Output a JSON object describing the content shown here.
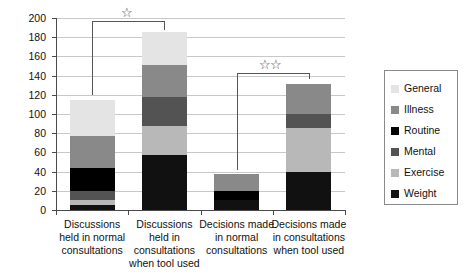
{
  "chart_data": {
    "type": "bar",
    "subtype": "stacked-bar",
    "title": "",
    "xlabel": "",
    "ylabel": "",
    "ylim": [
      0,
      200
    ],
    "ytick_step": 20,
    "yticks": [
      0,
      20,
      40,
      60,
      80,
      100,
      120,
      140,
      160,
      180,
      200
    ],
    "ytick_labels": [
      "0",
      "20",
      "40",
      "60",
      "80",
      "100",
      "120",
      "140",
      "160",
      "180",
      "200"
    ],
    "grid": true,
    "legend_position": "right",
    "categories": [
      "Discussions held in normal consultations",
      "Discussions held in consultations when tool used",
      "Decisions made in normal consultations",
      "Decisions made in consultations when tool used"
    ],
    "category_label_lines": [
      [
        "Discussions",
        "held in normal",
        "consultations"
      ],
      [
        "Discussions",
        "held in",
        "consultations",
        "when tool used"
      ],
      [
        "Decisions made",
        "in normal",
        "consultations"
      ],
      [
        "Decisions made",
        "in consultations",
        "when tool used"
      ]
    ],
    "series": [
      {
        "name": "Weight",
        "color": "#111111",
        "values": [
          5,
          57,
          10,
          40
        ]
      },
      {
        "name": "Exercise",
        "color": "#b8b8b8",
        "values": [
          5,
          31,
          0,
          45
        ]
      },
      {
        "name": "Mental",
        "color": "#535353",
        "values": [
          10,
          30,
          0,
          15
        ]
      },
      {
        "name": "Routine",
        "color": "#000000",
        "values": [
          24,
          0,
          10,
          0
        ]
      },
      {
        "name": "Illness",
        "color": "#898989",
        "values": [
          33,
          33,
          17,
          31
        ]
      },
      {
        "name": "General",
        "color": "#e4e4e4",
        "values": [
          38,
          34,
          0,
          0
        ]
      }
    ],
    "stack_order_bottom_to_top": [
      "Weight",
      "Exercise",
      "Mental",
      "Routine",
      "Illness",
      "General"
    ],
    "totals": [
      115,
      185,
      37,
      131
    ],
    "annotations": [
      {
        "name": "significance-bracket-discussions",
        "from_category": 0,
        "to_category": 1,
        "stars": "☆",
        "star_count": 1
      },
      {
        "name": "significance-bracket-decisions",
        "from_category": 2,
        "to_category": 3,
        "stars": "☆☆",
        "star_count": 2
      }
    ]
  },
  "legend": {
    "items": [
      {
        "label": "General",
        "color": "#e4e4e4"
      },
      {
        "label": "Illness",
        "color": "#898989"
      },
      {
        "label": "Routine",
        "color": "#000000"
      },
      {
        "label": "Mental",
        "color": "#535353"
      },
      {
        "label": "Exercise",
        "color": "#b8b8b8"
      },
      {
        "label": "Weight",
        "color": "#111111"
      }
    ]
  }
}
